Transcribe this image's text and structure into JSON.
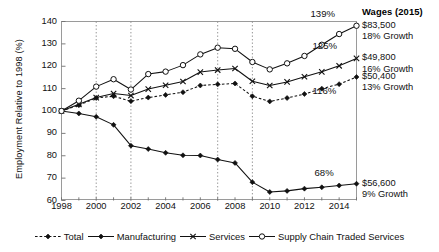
{
  "figure": {
    "wages_header": "Wages (2015)"
  },
  "chart_data": {
    "type": "line",
    "title": "",
    "xlabel": "",
    "ylabel": "Employment Relative to 1998 (%)",
    "xlim": [
      1998,
      2015
    ],
    "ylim": [
      60,
      140
    ],
    "yticks": [
      60,
      70,
      80,
      90,
      100,
      110,
      120,
      130,
      140
    ],
    "xticks": [
      1998,
      2000,
      2002,
      2004,
      2006,
      2008,
      2010,
      2012,
      2014
    ],
    "xticklabels": [
      "1998",
      "2000",
      "2002",
      "2004",
      "2006",
      "2008",
      "2010",
      "2012",
      "2014"
    ],
    "yticklabels": [
      "60",
      "70",
      "80",
      "90",
      "100",
      "110",
      "120",
      "130",
      "140"
    ],
    "grid": "vertical-dotted",
    "gridlines_x": [
      2000,
      2002,
      2007,
      2009
    ],
    "legend_position": "bottom",
    "x": [
      1998,
      1999,
      2000,
      2001,
      2002,
      2003,
      2004,
      2005,
      2006,
      2007,
      2008,
      2009,
      2010,
      2011,
      2012,
      2013,
      2014,
      2015
    ],
    "series": [
      {
        "name": "Total",
        "marker": "filled-diamond",
        "linestyle": "dashed",
        "values": [
          100.0,
          102.6,
          105.8,
          106.6,
          104.4,
          106.0,
          107.2,
          108.4,
          111.4,
          111.9,
          112.3,
          106.6,
          104.3,
          105.8,
          107.6,
          110.0,
          112.0,
          115.2
        ],
        "end_label": "116%",
        "wage": "$50,400",
        "wage_growth": "13% Growth"
      },
      {
        "name": "Manufacturing",
        "marker": "filled-diamond",
        "linestyle": "solid",
        "values": [
          100.0,
          98.9,
          97.4,
          93.8,
          84.5,
          83.0,
          81.3,
          80.2,
          80.1,
          78.3,
          76.8,
          68.2,
          63.8,
          64.3,
          65.3,
          65.9,
          66.7,
          67.5
        ],
        "end_label": "68%",
        "wage": "$56,600",
        "wage_growth": "9% Growth"
      },
      {
        "name": "Services",
        "marker": "x",
        "linestyle": "solid",
        "values": [
          100.0,
          103.0,
          106.0,
          107.8,
          106.9,
          109.8,
          111.5,
          113.2,
          117.4,
          118.3,
          119.0,
          113.3,
          111.4,
          113.0,
          115.3,
          117.5,
          120.2,
          123.5
        ],
        "end_label": "125%",
        "wage": "$49,800",
        "wage_growth": "16% Growth"
      },
      {
        "name": "Supply Chain Traded Services",
        "marker": "open-circle",
        "linestyle": "solid",
        "values": [
          100.0,
          104.6,
          110.9,
          114.2,
          109.6,
          116.5,
          117.6,
          120.5,
          125.3,
          128.3,
          127.8,
          121.9,
          118.6,
          121.3,
          124.6,
          129.6,
          134.4,
          138.1
        ],
        "end_label": "139%",
        "wage": "$83,500",
        "wage_growth": "18% Growth"
      }
    ]
  }
}
